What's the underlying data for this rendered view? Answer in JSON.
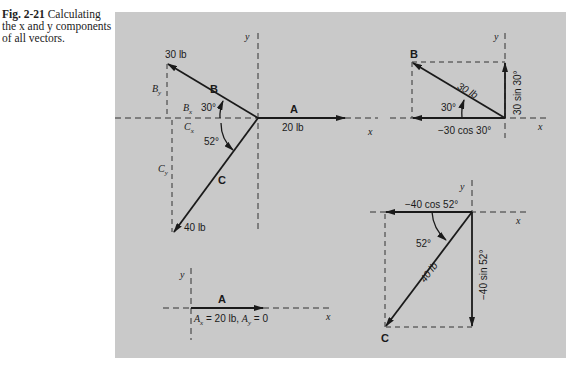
{
  "caption": {
    "figure_label": "Fig. 2-21",
    "text": "Calculating the x and y components of all vectors."
  },
  "panel_background": "#c9c9c9",
  "diagrams": {
    "main": {
      "axis_x": "x",
      "axis_y": "y",
      "vector_A": {
        "label": "A",
        "magnitude": "20 lb"
      },
      "vector_B": {
        "label": "B",
        "magnitude": "30 lb",
        "angle": "30°",
        "comp_x": "B",
        "comp_x_sub": "x",
        "comp_y": "B",
        "comp_y_sub": "y"
      },
      "vector_C": {
        "label": "C",
        "magnitude": "40 lb",
        "angle": "52°",
        "comp_x": "C",
        "comp_x_sub": "x",
        "comp_y": "C",
        "comp_y_sub": "y"
      }
    },
    "b_components": {
      "axis_x": "x",
      "axis_y": "y",
      "label": "B",
      "magnitude": "30 lb",
      "angle": "30°",
      "x_component": "−30 cos 30°",
      "y_component": "30 sin 30°"
    },
    "c_components": {
      "axis_x": "x",
      "axis_y": "y",
      "label": "C",
      "magnitude": "40 lb",
      "angle": "52°",
      "x_component": "−40 cos 52°",
      "y_component": "−40 sin 52°"
    },
    "a_components": {
      "axis_x": "x",
      "axis_y": "y",
      "label": "A",
      "equation_ax": "A",
      "equation_ax_sub": "x",
      "equation_mid": " = 20 lb, ",
      "equation_ay": "A",
      "equation_ay_sub": "y",
      "equation_end": " = 0"
    }
  }
}
